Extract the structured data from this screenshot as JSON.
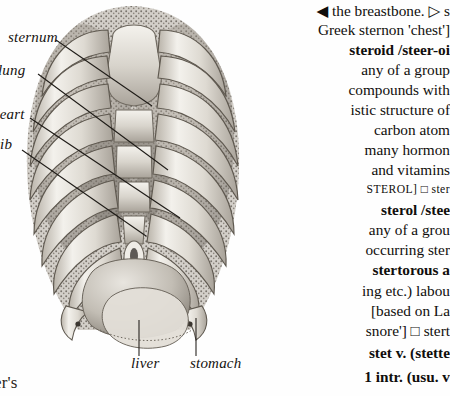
{
  "page": {
    "kind": "scanned-dictionary-page",
    "background_color": "#fefefe",
    "ink_color": "#100e0c",
    "width": 450,
    "height": 396
  },
  "illustration": {
    "caption_subject": "human thorax / ribcage anterior view",
    "style": "stipple-engraving",
    "labels": [
      {
        "name": "sternum",
        "text": "sternum"
      },
      {
        "name": "lung",
        "text": "lung"
      },
      {
        "name": "heart",
        "text": "heart"
      },
      {
        "name": "rib",
        "text": "rib"
      },
      {
        "name": "liver",
        "text": "liver"
      },
      {
        "name": "stomach",
        "text": "stomach"
      }
    ],
    "cut_off_text": {
      "top_left": "",
      "bottom_left": "er's"
    }
  },
  "column": {
    "lines": [
      {
        "id": "l01",
        "text": "◀ the breastbone. ▷ s",
        "align": "right"
      },
      {
        "id": "l02",
        "text": "Greek sternon 'chest']",
        "align": "right"
      },
      {
        "id": "l03",
        "text": "steroid /steer-oi",
        "align": "right"
      },
      {
        "id": "l04",
        "text": "any  of  a  group",
        "align": "right"
      },
      {
        "id": "l05",
        "text": "compounds with",
        "align": "right"
      },
      {
        "id": "l06",
        "text": "istic structure of",
        "align": "right"
      },
      {
        "id": "l07",
        "text": "carbon      atom",
        "align": "right"
      },
      {
        "id": "l08",
        "text": "many  hormon",
        "align": "right"
      },
      {
        "id": "l09",
        "text": "and  vitamins",
        "align": "right"
      },
      {
        "id": "l10",
        "text": "STEROL] □ ster",
        "align": "right"
      },
      {
        "id": "l11",
        "text": "sterol /stee",
        "align": "right"
      },
      {
        "id": "l12",
        "text": "any of a grou",
        "align": "right"
      },
      {
        "id": "l13",
        "text": "occurring ster",
        "align": "right"
      },
      {
        "id": "l14",
        "text": "stertorous a",
        "align": "right"
      },
      {
        "id": "l15",
        "text": "ing etc.) labou",
        "align": "right"
      },
      {
        "id": "l16",
        "text": "[based  on  La",
        "align": "right"
      },
      {
        "id": "l17",
        "text": "snore'] □ stert",
        "align": "right"
      },
      {
        "id": "l18",
        "text": "stet v. (stette",
        "align": "right"
      },
      {
        "id": "l19",
        "text": "1  intr.  (usu.  v",
        "align": "right"
      }
    ],
    "entries": [
      {
        "headword": "steroid",
        "pronunciation": "/steer-oi"
      },
      {
        "headword": "sterol",
        "pronunciation": "/stee"
      },
      {
        "headword": "stertorous",
        "pronunciation": ""
      },
      {
        "headword": "stet",
        "pronunciation": ""
      }
    ],
    "etymology_note": "Greek sternon 'chest'",
    "cross_reference": "STEROL"
  }
}
